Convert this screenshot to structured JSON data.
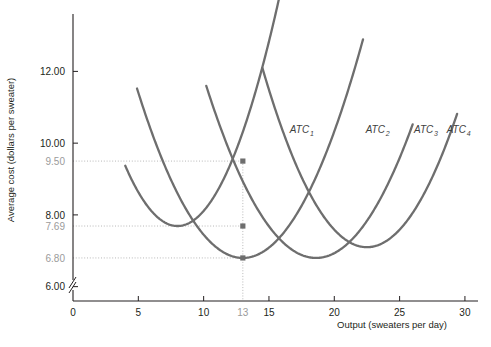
{
  "chart_data": {
    "type": "line",
    "title": "",
    "xlabel": "Output (sweaters per day)",
    "ylabel": "Average cost (dollars per sweater)",
    "xlim": [
      0,
      31
    ],
    "ylim": [
      5.6,
      13.6
    ],
    "grid": false,
    "axis_break_y": true,
    "x_ticks": [
      {
        "value": 0,
        "label": "0",
        "highlight": false
      },
      {
        "value": 5,
        "label": "5",
        "highlight": false
      },
      {
        "value": 10,
        "label": "10",
        "highlight": false
      },
      {
        "value": 13,
        "label": "13",
        "highlight": true
      },
      {
        "value": 15,
        "label": "15",
        "highlight": false
      },
      {
        "value": 20,
        "label": "20",
        "highlight": false
      },
      {
        "value": 25,
        "label": "25",
        "highlight": false
      },
      {
        "value": 30,
        "label": "30",
        "highlight": false
      }
    ],
    "y_ticks": [
      {
        "value": 12.0,
        "label": "12.00",
        "highlight": false
      },
      {
        "value": 10.0,
        "label": "10.00",
        "highlight": false
      },
      {
        "value": 9.5,
        "label": "9.50",
        "highlight": true
      },
      {
        "value": 8.0,
        "label": "8.00",
        "highlight": false
      },
      {
        "value": 7.69,
        "label": "7.69",
        "highlight": true
      },
      {
        "value": 6.8,
        "label": "6.80",
        "highlight": true
      },
      {
        "value": 6.0,
        "label": "6.00",
        "highlight": false
      }
    ],
    "series": [
      {
        "name": "ATC1",
        "label": "ATC",
        "subscript": "1",
        "label_x": 16.6,
        "label_y": 10.28,
        "min_x": 8.0,
        "min_y": 7.69,
        "curvature": 0.105,
        "x_start": 4.0,
        "x_end": 16.0
      },
      {
        "name": "ATC2",
        "label": "ATC",
        "subscript": "2",
        "label_x": 22.4,
        "label_y": 10.28,
        "min_x": 13.0,
        "min_y": 6.8,
        "curvature": 0.072,
        "x_start": 4.9,
        "x_end": 22.2
      },
      {
        "name": "ATC3",
        "label": "ATC",
        "subscript": "3",
        "label_x": 26.1,
        "label_y": 10.28,
        "min_x": 18.6,
        "min_y": 6.8,
        "curvature": 0.068,
        "x_start": 10.2,
        "x_end": 26.0
      },
      {
        "name": "ATC4",
        "label": "ATC",
        "subscript": "4",
        "label_x": 28.6,
        "label_y": 10.28,
        "min_x": 22.5,
        "min_y": 7.1,
        "curvature": 0.078,
        "x_start": 14.5,
        "x_end": 29.4
      }
    ],
    "points": [
      {
        "x": 13,
        "y": 9.5,
        "series": "ATC1"
      },
      {
        "x": 13,
        "y": 7.69,
        "series": "ATC1-ATC3-intersection"
      },
      {
        "x": 13,
        "y": 6.8,
        "series": "ATC2"
      }
    ],
    "guide_lines": [
      {
        "orientation": "horizontal",
        "value": 9.5
      },
      {
        "orientation": "horizontal",
        "value": 7.69
      },
      {
        "orientation": "horizontal",
        "value": 6.8
      },
      {
        "orientation": "vertical",
        "value": 13
      }
    ],
    "colors": {
      "curve": "#6e6e6e",
      "axis": "#231f20",
      "guide": "#b8b8b8",
      "highlight_text": "#9b9b9b",
      "marker": "#6e6e6e"
    }
  }
}
